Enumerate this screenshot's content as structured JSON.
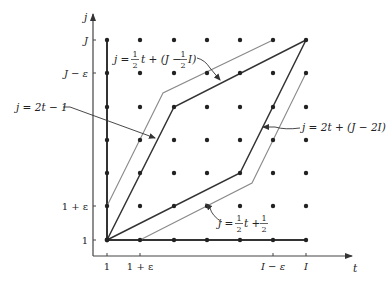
{
  "figure": {
    "type": "lattice-path diagram (dynamic time warping band)",
    "axes": {
      "x_label": "t",
      "y_label": "j",
      "x_ticks": [
        "1",
        "1 + ε",
        "I − ε",
        "I"
      ],
      "y_ticks": [
        "J",
        "J − ε",
        "1 + ε",
        "1"
      ]
    },
    "grid": {
      "columns": 7,
      "rows": 7
    },
    "annotations": {
      "upper_line": {
        "lhs": "j = ",
        "n1": "1",
        "d1": "2",
        "mid": " t + (J − ",
        "n2": "1",
        "d2": "2",
        "tail": " I)"
      },
      "steep_left": "j = 2t − 1",
      "steep_right": "j = 2t + (J − 2I)",
      "lower_line": {
        "lhs": "j = ",
        "n1": "1",
        "d1": "2",
        "mid": " t + ",
        "n2": "1",
        "d2": "2"
      }
    },
    "colors": {
      "dark_line": "#333333",
      "light_line": "#8a8a8a",
      "dot": "#222222"
    }
  }
}
